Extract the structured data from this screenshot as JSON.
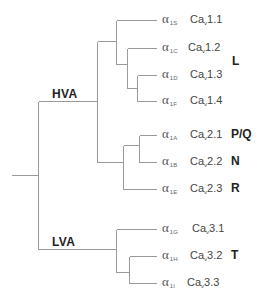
{
  "diagram": {
    "type": "phylogenetic-tree",
    "line_color": "#9a9a9a",
    "groups": [
      {
        "label": "HVA"
      },
      {
        "label": "LVA"
      }
    ],
    "leaves": [
      {
        "alpha": "α",
        "alpha_sub": "1S",
        "cav": "Ca",
        "cav_sub": "v",
        "cav_num": "1.1",
        "type": ""
      },
      {
        "alpha": "α",
        "alpha_sub": "1C",
        "cav": "Ca",
        "cav_sub": "v",
        "cav_num": "1.2",
        "type": ""
      },
      {
        "alpha": "α",
        "alpha_sub": "1D",
        "cav": "Ca",
        "cav_sub": "v",
        "cav_num": "1.3",
        "type": ""
      },
      {
        "alpha": "α",
        "alpha_sub": "1F",
        "cav": "Ca",
        "cav_sub": "v",
        "cav_num": "1.4",
        "type": ""
      },
      {
        "alpha": "α",
        "alpha_sub": "1A",
        "cav": "Ca",
        "cav_sub": "v",
        "cav_num": "2.1",
        "type": "P/Q"
      },
      {
        "alpha": "α",
        "alpha_sub": "1B",
        "cav": "Ca",
        "cav_sub": "v",
        "cav_num": "2.2",
        "type": "N"
      },
      {
        "alpha": "α",
        "alpha_sub": "1E",
        "cav": "Ca",
        "cav_sub": "v",
        "cav_num": "2.3",
        "type": "R"
      },
      {
        "alpha": "α",
        "alpha_sub": "1G",
        "cav": "Ca",
        "cav_sub": "v",
        "cav_num": "3.1",
        "type": ""
      },
      {
        "alpha": "α",
        "alpha_sub": "1H",
        "cav": "Ca",
        "cav_sub": "v",
        "cav_num": "3.2",
        "type": "T"
      },
      {
        "alpha": "α",
        "alpha_sub": "1I",
        "cav": "Ca",
        "cav_sub": "v",
        "cav_num": "3.3",
        "type": ""
      }
    ],
    "clade_types": {
      "L": "L"
    }
  }
}
